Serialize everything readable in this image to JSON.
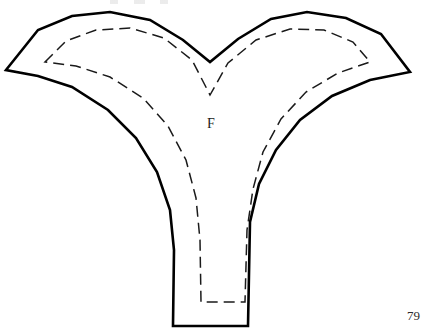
{
  "document": {
    "kind": "sewing-pattern-scan",
    "page_number": "79",
    "background_color": "#ffffff",
    "ink_color": "#000000",
    "width": 429,
    "height": 330
  },
  "pattern_piece": {
    "label": "F",
    "label_position": {
      "x": 213,
      "y": 125
    },
    "cutting_line": {
      "name": "cutting-line",
      "stroke_color": "#000000",
      "stroke_width": 2.6,
      "style": "solid",
      "path": "M 6 70 L 38 30 L 72 16 L 110 12 L 150 20 L 183 40 L 210 62 L 238 39 L 271 19 L 307 12 L 346 18 L 381 34 L 410 72 L 370 80 L 332 96 L 300 120 L 276 150 L 259 184 L 250 222 L 248 326 L 173 326 L 174 250 L 170 210 L 157 172 L 136 138 L 108 110 L 72 87 L 38 76 Z"
    },
    "seam_line": {
      "name": "seam-allowance-line",
      "stroke_color": "#1a1a1a",
      "stroke_width": 1.5,
      "style": "dashed",
      "dash_length": 11,
      "gap_length": 6,
      "path": "M 45 62 L 66 41 L 96 30 L 130 28 L 164 38 L 192 60 L 210 95 L 228 63 L 256 40 L 290 29 L 324 30 L 353 42 L 370 62 L 338 73 L 306 92 L 281 119 L 263 152 L 253 189 L 247 230 L 245 302 L 201 302 L 200 240 L 196 198 L 186 160 L 168 126 L 143 98 L 110 77 L 76 66 Z"
    },
    "key_points": {
      "left_tip": {
        "x": 6,
        "y": 70
      },
      "right_tip": {
        "x": 410,
        "y": 72
      },
      "left_peak": {
        "x": 110,
        "y": 12
      },
      "right_peak": {
        "x": 307,
        "y": 12
      },
      "center_notch": {
        "x": 210,
        "y": 62
      },
      "seam_notch": {
        "x": 210,
        "y": 95
      },
      "stem_bottom_left": {
        "x": 173,
        "y": 326
      },
      "stem_bottom_right": {
        "x": 248,
        "y": 326
      }
    }
  }
}
